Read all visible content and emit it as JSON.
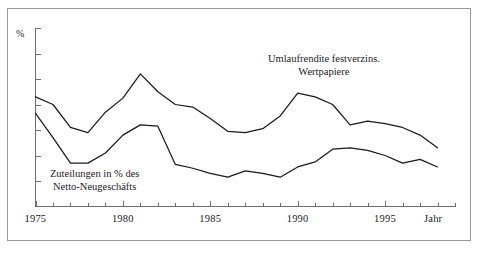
{
  "chart_data": {
    "type": "line",
    "title": "",
    "subtitle": "",
    "xlabel": "Jahr",
    "ylabel": "%",
    "grid": false,
    "legend_position": "inline-annotations",
    "xlim": [
      1975,
      1999
    ],
    "ylim": [
      0,
      14
    ],
    "x_tick_labels": [
      "1975",
      "1980",
      "1985",
      "1990",
      "1995"
    ],
    "x_labeled_years": [
      1975,
      1980,
      1985,
      1990,
      1995
    ],
    "x_minor_ticks_every": 1,
    "y_ticks_unlabeled": true,
    "y_tick_count": 7,
    "x": [
      1975,
      1976,
      1977,
      1978,
      1979,
      1980,
      1981,
      1982,
      1983,
      1984,
      1985,
      1986,
      1987,
      1988,
      1989,
      1990,
      1991,
      1992,
      1993,
      1994,
      1995,
      1996,
      1997,
      1998
    ],
    "series": [
      {
        "name": "Umlaufrendite festverzins. Wertpapiere",
        "label_line_1": "Umlaufrendite festverzins.",
        "label_line_2": "Wertpapiere",
        "values": [
          8.6,
          8.0,
          6.2,
          5.8,
          7.4,
          8.5,
          10.4,
          9.0,
          8.0,
          7.8,
          6.9,
          5.9,
          5.8,
          6.1,
          7.1,
          8.9,
          8.6,
          8.0,
          6.4,
          6.7,
          6.5,
          6.2,
          5.6,
          4.6
        ],
        "annotation_x": 1991.5,
        "annotation_y": 11.1
      },
      {
        "name": "Zuteilungen in % des Netto-Neugeschäfts",
        "label_line_1": "Zuteilungen in % des",
        "label_line_2": "Netto-Neugeschäfts",
        "values": [
          7.3,
          5.4,
          3.4,
          3.4,
          4.2,
          5.6,
          6.4,
          6.3,
          3.3,
          3.0,
          2.6,
          2.3,
          2.8,
          2.6,
          2.3,
          3.1,
          3.5,
          4.5,
          4.6,
          4.4,
          4.0,
          3.4,
          3.7,
          3.1
        ],
        "annotation_x": 1978.4,
        "annotation_y": 2.05
      }
    ]
  },
  "axis": {
    "y_unit_label": "%",
    "x_axis_caption": "Jahr"
  }
}
